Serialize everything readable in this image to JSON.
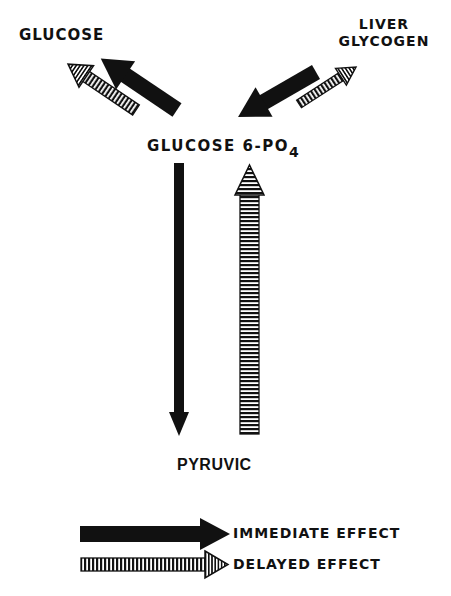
{
  "diagram": {
    "nodes": {
      "glucose": "GLUCOSE",
      "liver_glycogen_line1": "LIVER",
      "liver_glycogen_line2": "GLYCOGEN",
      "glucose_6_po4_main": "GLUCOSE 6-PO",
      "glucose_6_po4_sub": "4",
      "pyruvic": "PYRUVIC"
    },
    "edges": [
      {
        "from": "GLUCOSE 6-PO4",
        "to": "GLUCOSE",
        "style": "delayed"
      },
      {
        "from": "GLUCOSE 6-PO4",
        "to": "GLUCOSE",
        "style": "immediate"
      },
      {
        "from": "LIVER GLYCOGEN",
        "to": "GLUCOSE 6-PO4",
        "style": "immediate"
      },
      {
        "from": "GLUCOSE 6-PO4",
        "to": "LIVER GLYCOGEN",
        "style": "delayed"
      },
      {
        "from": "GLUCOSE 6-PO4",
        "to": "PYRUVIC",
        "style": "immediate"
      },
      {
        "from": "PYRUVIC",
        "to": "GLUCOSE 6-PO4",
        "style": "delayed"
      }
    ],
    "legend": [
      {
        "style": "immediate",
        "label": "IMMEDIATE EFFECT",
        "icon": "solid-arrow-icon"
      },
      {
        "style": "delayed",
        "label": "DELAYED EFFECT",
        "icon": "striped-arrow-icon"
      }
    ],
    "colors": {
      "ink": "#111111",
      "background": "#ffffff"
    }
  }
}
